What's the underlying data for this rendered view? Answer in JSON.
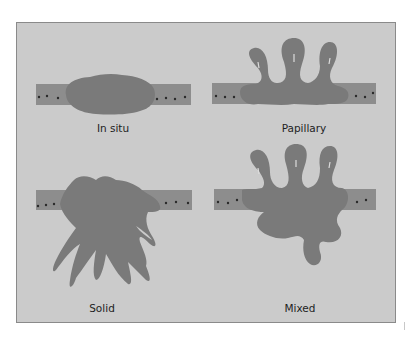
{
  "figure": {
    "panels": [
      {
        "id": "in-situ",
        "label": "In situ"
      },
      {
        "id": "papillary",
        "label": "Papillary"
      },
      {
        "id": "solid",
        "label": "Solid"
      },
      {
        "id": "mixed",
        "label": "Mixed"
      }
    ],
    "colors": {
      "background": "#cbcbcb",
      "epithelium": "#8d8d8d",
      "tumor": "#7a7a7a",
      "nuclei": "#2a2a2a",
      "border": "#8a8a8a"
    }
  }
}
